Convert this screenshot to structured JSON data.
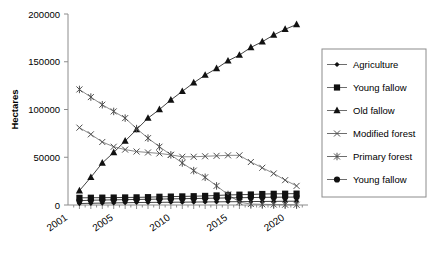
{
  "chart_data": {
    "type": "line",
    "title": "",
    "xlabel": "",
    "ylabel": "Hectares",
    "xlim": [
      2001,
      2022
    ],
    "ylim": [
      0,
      200000
    ],
    "grid": false,
    "legend_position": "right",
    "xtick_labels": [
      "2001",
      "2005",
      "2010",
      "2015",
      "2020"
    ],
    "xtick_values": [
      2001,
      2005,
      2010,
      2015,
      2020
    ],
    "ytick_labels": [
      "0",
      "50000",
      "100000",
      "150000",
      "200000"
    ],
    "ytick_values": [
      0,
      50000,
      100000,
      150000,
      200000
    ],
    "x": [
      2002,
      2003,
      2004,
      2005,
      2006,
      2007,
      2008,
      2009,
      2010,
      2011,
      2012,
      2013,
      2014,
      2015,
      2016,
      2017,
      2018,
      2019,
      2020,
      2021
    ],
    "series": [
      {
        "name": "Agriculture",
        "marker": "diamond",
        "values": [
          1500,
          1800,
          2000,
          2200,
          2400,
          2600,
          2700,
          2800,
          2900,
          3000,
          3100,
          3200,
          3300,
          3400,
          3500,
          3600,
          3700,
          3800,
          3900,
          4000
        ]
      },
      {
        "name": "Young fallow",
        "marker": "square",
        "values": [
          7500,
          7600,
          7700,
          7800,
          7900,
          8000,
          8200,
          8600,
          8800,
          9000,
          9200,
          9500,
          10000,
          10500,
          10800,
          11000,
          11500,
          11700,
          11800,
          11900
        ]
      },
      {
        "name": "Old fallow",
        "marker": "triangle",
        "values": [
          15000,
          29000,
          44000,
          55000,
          67000,
          79000,
          91000,
          100000,
          110000,
          119000,
          128000,
          136000,
          143000,
          151000,
          157000,
          165000,
          171000,
          178000,
          184000,
          189000
        ]
      },
      {
        "name": "Modified forest",
        "marker": "x",
        "values": [
          81000,
          74000,
          66000,
          61000,
          58000,
          56000,
          55000,
          54000,
          52500,
          50500,
          50500,
          51000,
          51500,
          52000,
          52000,
          45000,
          39000,
          33000,
          26000,
          20000
        ]
      },
      {
        "name": "Primary forest",
        "marker": "asterisk",
        "values": [
          121000,
          113000,
          105000,
          98000,
          91000,
          80000,
          70000,
          61000,
          52500,
          44000,
          36000,
          29000,
          20000,
          11000,
          3000,
          1000,
          700,
          500,
          300,
          200
        ]
      },
      {
        "name": "Young fallow",
        "marker": "circle",
        "values": [
          4500,
          5000,
          5200,
          5400,
          5600,
          5800,
          6000,
          6200,
          6400,
          6600,
          6800,
          7000,
          7200,
          7400,
          7600,
          7800,
          8000,
          8100,
          8200,
          8300
        ]
      }
    ],
    "legend_entries": [
      {
        "label": "Agriculture",
        "marker": "diamond"
      },
      {
        "label": "Young fallow",
        "marker": "square"
      },
      {
        "label": "Old fallow",
        "marker": "triangle"
      },
      {
        "label": "Modified forest",
        "marker": "x"
      },
      {
        "label": "Primary forest",
        "marker": "asterisk"
      },
      {
        "label": "Young fallow",
        "marker": "circle"
      }
    ]
  }
}
